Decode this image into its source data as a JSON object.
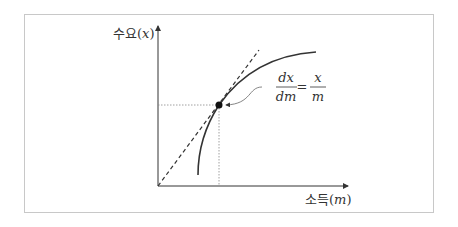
{
  "diagram": {
    "y_axis": {
      "label_kr": "수요",
      "label_var": "x"
    },
    "x_axis": {
      "label_kr": "소득",
      "label_var": "m"
    },
    "equation": {
      "num_left": "dx",
      "den_left": "dm",
      "equals": "=",
      "num_right": "x",
      "den_right": "m"
    },
    "colors": {
      "frame": "#c8c8c8",
      "line": "#333333",
      "dotted": "#888888"
    }
  }
}
